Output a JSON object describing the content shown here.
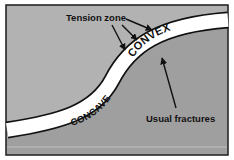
{
  "diagram": {
    "labels": {
      "tension_zone": "Tension zone",
      "convex": "CONVEX",
      "concave": "CONCAVE",
      "usual_fractures": "Usual fractures"
    },
    "colors": {
      "background_upper": "#b4b4b4",
      "background_lower": "#a0a0a0",
      "band_fill": "#ffffff",
      "outline": "#111111",
      "border": "#1a1a1a"
    }
  }
}
